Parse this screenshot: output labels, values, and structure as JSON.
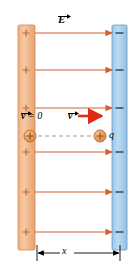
{
  "figure": {
    "width": 134,
    "height": 267
  },
  "plates": {
    "left": {
      "name": "positive-plate",
      "sign": "+",
      "sign_count": 6,
      "color": "#f2b384",
      "border_color": "#d08a52",
      "x": 18,
      "y": 25,
      "width": 17,
      "height": 225
    },
    "right": {
      "name": "negative-plate",
      "sign": "−",
      "sign_count": 6,
      "color": "#a8cce8",
      "border_color": "#5f9bc9",
      "x": 112,
      "y": 25,
      "width": 15,
      "height": 225
    }
  },
  "field": {
    "label": "E",
    "label_full": "E vector",
    "line_color": "#d2622a",
    "line_count": 6,
    "line_y": [
      33,
      70,
      108,
      152,
      192,
      232
    ],
    "x_start": 35,
    "x_end": 114
  },
  "charges": [
    {
      "name": "charge-initial",
      "sign": "+",
      "cx": 30,
      "cy": 136,
      "r": 6,
      "fill": "#e8a060",
      "border": "#c4682c"
    },
    {
      "name": "charge-final",
      "sign": "+",
      "cx": 100,
      "cy": 136,
      "r": 6,
      "fill": "#e8a060",
      "border": "#c4682c"
    }
  ],
  "labels": {
    "velocity_initial": "v",
    "velocity_initial_value": " = 0",
    "velocity_final": "v",
    "charge": "q",
    "distance": "x",
    "field": "E"
  },
  "velocity_arrow": {
    "name": "velocity-vector-arrow",
    "color": "#e02b16",
    "x_start": 78,
    "x_end": 104,
    "y": 116
  },
  "trajectory": {
    "name": "dashed-trajectory",
    "color": "#8a8a8a",
    "x_start": 38,
    "x_end": 92,
    "y": 136,
    "style": "dashed"
  },
  "dimension": {
    "name": "distance-dimension-line",
    "label": "x",
    "color": "#000000",
    "x_start": 37,
    "x_end": 120,
    "y": 253
  },
  "colors": {
    "positive_plate": "#f2b384",
    "negative_plate": "#a8cce8",
    "field_line": "#d2622a",
    "velocity_arrow": "#e02b16",
    "charge_fill": "#e8a060",
    "dimension_line": "#000000"
  }
}
